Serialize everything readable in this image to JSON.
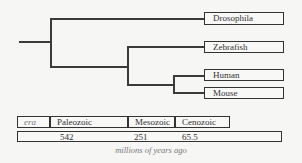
{
  "tree": {
    "leaves": [
      {
        "label": "Drosophila"
      },
      {
        "label": "Zebrafish"
      },
      {
        "label": "Human"
      },
      {
        "label": "Mouse"
      }
    ]
  },
  "timeline": {
    "era_label": "era",
    "eras": [
      "Paleozoic",
      "Mesozoic",
      "Cenozoic"
    ],
    "ages": [
      "542",
      "251",
      "65.5"
    ],
    "caption": "millions of years ago"
  },
  "colors": {
    "line": "#3a3a3a",
    "background": "#f6f6f5",
    "caption": "#777777"
  }
}
